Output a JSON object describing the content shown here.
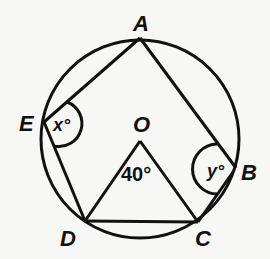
{
  "diagram": {
    "circle": {
      "center": "O",
      "cx": 140,
      "cy": 139,
      "r": 99
    },
    "points": {
      "A": {
        "label": "A",
        "x": 140,
        "y": 38
      },
      "B": {
        "label": "B",
        "x": 236,
        "y": 168
      },
      "C": {
        "label": "C",
        "x": 198,
        "y": 222
      },
      "D": {
        "label": "D",
        "x": 85,
        "y": 221
      },
      "E": {
        "label": "E",
        "x": 44,
        "y": 122
      },
      "O": {
        "label": "O",
        "x": 140,
        "y": 140
      }
    },
    "segments": [
      "AE",
      "AB",
      "ED",
      "BC",
      "DC",
      "OD",
      "OC"
    ],
    "angles": {
      "x": {
        "label": "x°",
        "vertex": "E"
      },
      "y": {
        "label": "y°",
        "vertex": "B"
      },
      "central": {
        "label": "40°",
        "vertex": "O"
      }
    },
    "colors": {
      "stroke": "#111111",
      "background": "#f7f7f5"
    }
  }
}
